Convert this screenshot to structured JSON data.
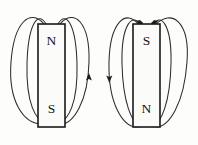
{
  "figure": {
    "background_color": "#fdfdfc",
    "line_color": "#2c2c2c",
    "label_color": "#121212",
    "magnet_fill": "#fbfbfa",
    "magnet_stroke": "#1a1a1a"
  },
  "magnets": [
    {
      "id": "left-magnet",
      "name": "left-bar-magnet",
      "x": 38,
      "y": 24,
      "width": 27,
      "height": 103,
      "top_pole": "N",
      "bottom_pole": "S",
      "field_direction": "out-of-top-into-bottom",
      "arrow_count": 3,
      "arrows": [
        {
          "name": "left-inner-arrow-into-south",
          "x": 46,
          "y": 124,
          "direction": "down-right"
        },
        {
          "name": "left-outer-arrow-into-south",
          "x": 59,
          "y": 124,
          "direction": "down-left"
        },
        {
          "name": "left-outer-right-arrow-upward",
          "x": 84,
          "y": 78,
          "direction": "up"
        }
      ]
    },
    {
      "id": "right-magnet",
      "name": "right-bar-magnet",
      "x": 133,
      "y": 24,
      "width": 27,
      "height": 103,
      "top_pole": "S",
      "bottom_pole": "N",
      "field_direction": "into-top-out-of-bottom",
      "arrow_count": 3,
      "arrows": [
        {
          "name": "right-inner-arrow-into-south",
          "x": 141,
          "y": 27,
          "direction": "down-right"
        },
        {
          "name": "right-outer-arrow-into-south",
          "x": 154,
          "y": 27,
          "direction": "down-left"
        },
        {
          "name": "right-outer-left-arrow-downward",
          "x": 113,
          "y": 78,
          "direction": "down"
        }
      ]
    }
  ],
  "labels": {
    "left_top": "N",
    "left_bottom": "S",
    "right_top": "S",
    "right_bottom": "N"
  },
  "field_loops": {
    "left_outer_count": 2,
    "left_inner_count": 2,
    "right_outer_count": 2,
    "right_inner_count": 2,
    "description": "Closed elliptical loops around each bar magnet"
  }
}
